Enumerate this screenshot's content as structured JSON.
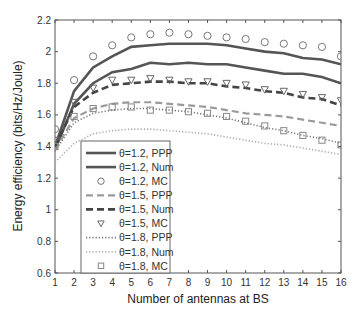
{
  "chart_data": {
    "type": "line",
    "title": "",
    "xlabel": "Number of antennas at BS",
    "ylabel": "Energy efficiency (bits/Hz/Joule)",
    "xlim": [
      1,
      16
    ],
    "ylim": [
      0.6,
      2.2
    ],
    "xticks": [
      1,
      2,
      3,
      4,
      5,
      6,
      7,
      8,
      9,
      10,
      11,
      12,
      13,
      14,
      15,
      16
    ],
    "yticks": [
      0.6,
      0.8,
      1,
      1.2,
      1.4,
      1.6,
      1.8,
      2,
      2.2
    ],
    "ytick_labels": [
      "0.6",
      "0.8",
      "1",
      "1.2",
      "1.4",
      "1.6",
      "1.8",
      "2",
      "2.2"
    ],
    "grid": false,
    "legend_position": "lower left (inside)",
    "x": [
      1,
      2,
      3,
      4,
      5,
      6,
      7,
      8,
      9,
      10,
      11,
      12,
      13,
      14,
      15,
      16
    ],
    "series": [
      {
        "name": "θ=1.2, PPP",
        "style": "solid",
        "color": "#555555",
        "width": 2.6,
        "marker": "none",
        "values": [
          1.4,
          1.75,
          1.9,
          1.97,
          2.03,
          2.04,
          2.05,
          2.05,
          2.05,
          2.04,
          2.02,
          2.0,
          1.99,
          1.96,
          1.95,
          1.92
        ]
      },
      {
        "name": "θ=1.2, Num",
        "style": "solid",
        "color": "#555555",
        "width": 2.6,
        "marker": "none",
        "values": [
          1.38,
          1.67,
          1.8,
          1.87,
          1.89,
          1.93,
          1.92,
          1.93,
          1.92,
          1.92,
          1.9,
          1.88,
          1.86,
          1.86,
          1.84,
          1.8
        ]
      },
      {
        "name": "θ=1.2, MC",
        "style": "none",
        "color": "#777777",
        "width": 1,
        "marker": "circle",
        "values": [
          1.51,
          1.82,
          1.97,
          2.04,
          2.09,
          2.11,
          2.12,
          2.11,
          2.1,
          2.09,
          2.08,
          2.06,
          2.05,
          2.04,
          2.03,
          1.97
        ]
      },
      {
        "name": "θ=1.5, PPP",
        "style": "dashed",
        "color": "#9a9a9a",
        "width": 2.2,
        "marker": "none",
        "values": [
          1.38,
          1.58,
          1.64,
          1.67,
          1.68,
          1.68,
          1.67,
          1.66,
          1.65,
          1.63,
          1.61,
          1.6,
          1.59,
          1.57,
          1.55,
          1.53
        ]
      },
      {
        "name": "θ=1.5, Num",
        "style": "dashed",
        "color": "#444444",
        "width": 2.6,
        "marker": "none",
        "values": [
          1.4,
          1.65,
          1.74,
          1.79,
          1.8,
          1.81,
          1.81,
          1.8,
          1.8,
          1.78,
          1.77,
          1.75,
          1.74,
          1.71,
          1.7,
          1.66
        ]
      },
      {
        "name": "θ=1.5, MC",
        "style": "none",
        "color": "#666666",
        "width": 1,
        "marker": "triangle-down",
        "values": [
          1.44,
          1.68,
          1.77,
          1.82,
          1.82,
          1.83,
          1.82,
          1.81,
          1.81,
          1.8,
          1.79,
          1.76,
          1.75,
          1.73,
          1.71,
          1.69
        ]
      },
      {
        "name": "θ=1.8, PPP",
        "style": "dotted",
        "color": "#777777",
        "width": 1.6,
        "marker": "none",
        "values": [
          1.37,
          1.55,
          1.61,
          1.63,
          1.64,
          1.64,
          1.63,
          1.62,
          1.6,
          1.58,
          1.55,
          1.52,
          1.5,
          1.47,
          1.45,
          1.42
        ]
      },
      {
        "name": "θ=1.8, Num",
        "style": "dotted",
        "color": "#aaaaaa",
        "width": 1.6,
        "marker": "none",
        "values": [
          1.3,
          1.42,
          1.48,
          1.5,
          1.51,
          1.51,
          1.5,
          1.49,
          1.48,
          1.46,
          1.44,
          1.42,
          1.41,
          1.39,
          1.37,
          1.35
        ]
      },
      {
        "name": "θ=1.8, MC",
        "style": "none",
        "color": "#888888",
        "width": 1,
        "marker": "square",
        "values": [
          1.4,
          1.59,
          1.64,
          1.65,
          1.65,
          1.63,
          1.63,
          1.62,
          1.61,
          1.59,
          1.56,
          1.53,
          1.5,
          1.47,
          1.44,
          1.41
        ]
      }
    ]
  },
  "labels": {
    "xlabel": "Number of antennas at BS",
    "ylabel": "Energy efficiency (bits/Hz/Joule)"
  },
  "legend": [
    "θ=1.2, PPP",
    "θ=1.2, Num",
    "θ=1.2, MC",
    "θ=1.5, PPP",
    "θ=1.5, Num",
    "θ=1.5, MC",
    "θ=1.8, PPP",
    "θ=1.8, Num",
    "θ=1.8, MC"
  ],
  "colors": {
    "axis": "#555555",
    "legend_border": "#666666"
  }
}
